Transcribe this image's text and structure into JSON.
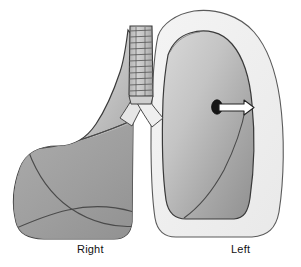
{
  "figure": {
    "background_color": "#ffffff"
  },
  "labels": {
    "right": "Right",
    "left": "Left"
  },
  "colors": {
    "lung_fill_light": "#d8d8d8",
    "lung_fill_mid": "#b5b5b5",
    "lung_fill_dark": "#9a9a9a",
    "chest_cavity_fill": "#efefef",
    "outline": "#3a3a3a",
    "fissure_line": "#4a4a4a",
    "trachea_fill": "#c9c9c9",
    "trachea_ring": "#6b6b6b",
    "lesion_fill": "#151515",
    "arrow_fill": "#ffffff",
    "arrow_outline": "#222222",
    "label_text": "#111111"
  },
  "parts": {
    "right_lung": "right-lung",
    "left_lung_collapsed": "left-lung-collapsed",
    "chest_cavity": "chest-cavity-outline",
    "trachea": "trachea",
    "right_main_bronchus": "right-main-bronchus",
    "left_main_bronchus": "left-main-bronchus",
    "horizontal_fissure": "horizontal-fissure",
    "oblique_fissure_right": "right-oblique-fissure",
    "oblique_fissure_left": "left-oblique-fissure",
    "lesion": "pleural-lesion",
    "pointer": "pointer-arrow"
  }
}
